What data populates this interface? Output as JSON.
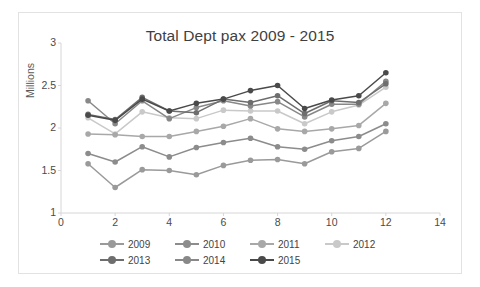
{
  "chart_data": {
    "type": "line",
    "title": "Total Dept pax 2009 - 2015",
    "xlabel": "",
    "ylabel": "Millions",
    "x": [
      1,
      2,
      3,
      4,
      5,
      6,
      7,
      8,
      9,
      10,
      11,
      12
    ],
    "xlim": [
      0,
      14
    ],
    "ylim": [
      1,
      3
    ],
    "xticks": [
      "0",
      "2",
      "4",
      "6",
      "8",
      "10",
      "12",
      "14"
    ],
    "xtick_values": [
      0,
      2,
      4,
      6,
      8,
      10,
      12,
      14
    ],
    "yticks": [
      "1",
      "1.5",
      "2",
      "2.5",
      "3"
    ],
    "ytick_values": [
      1,
      1.5,
      2,
      2.5,
      3
    ],
    "grid": false,
    "legend_position": "bottom",
    "series": [
      {
        "name": "2009",
        "color": "#9a9a9a",
        "values": [
          1.58,
          1.3,
          1.51,
          1.5,
          1.45,
          1.56,
          1.62,
          1.63,
          1.58,
          1.72,
          1.76,
          1.96
        ]
      },
      {
        "name": "2010",
        "color": "#8c8c8c",
        "values": [
          1.7,
          1.6,
          1.78,
          1.66,
          1.77,
          1.83,
          1.88,
          1.78,
          1.75,
          1.85,
          1.9,
          2.05
        ]
      },
      {
        "name": "2011",
        "color": "#a8a8a8",
        "values": [
          1.93,
          1.92,
          1.9,
          1.9,
          1.96,
          2.02,
          2.11,
          1.99,
          1.96,
          1.99,
          2.03,
          2.29
        ]
      },
      {
        "name": "2012",
        "color": "#c9c9c9",
        "values": [
          2.12,
          1.93,
          2.19,
          2.12,
          2.11,
          2.21,
          2.2,
          2.2,
          2.05,
          2.19,
          2.27,
          2.48
        ]
      },
      {
        "name": "2013",
        "color": "#6e6e6e",
        "values": [
          2.16,
          2.1,
          2.36,
          2.2,
          2.18,
          2.34,
          2.3,
          2.38,
          2.17,
          2.32,
          2.3,
          2.52
        ]
      },
      {
        "name": "2014",
        "color": "#888888",
        "values": [
          2.32,
          2.05,
          2.32,
          2.11,
          2.24,
          2.32,
          2.26,
          2.31,
          2.13,
          2.28,
          2.28,
          2.55
        ]
      },
      {
        "name": "2015",
        "color": "#4a4a4a",
        "values": [
          2.15,
          2.09,
          2.34,
          2.2,
          2.29,
          2.34,
          2.44,
          2.5,
          2.23,
          2.33,
          2.38,
          2.65
        ]
      }
    ]
  },
  "legend": {
    "rows": [
      [
        "2009",
        "2010",
        "2011",
        "2012"
      ],
      [
        "2013",
        "2014",
        "2015"
      ]
    ]
  }
}
